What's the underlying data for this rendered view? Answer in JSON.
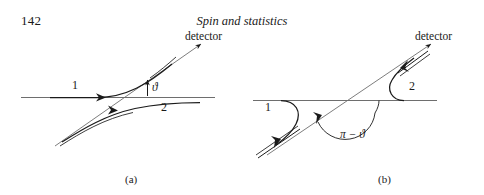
{
  "page": {
    "folio": "142",
    "running_title": "Spin and statistics",
    "width": 484,
    "height": 195,
    "background": "#ffffff",
    "ink": "#1a1a1a"
  },
  "figure": {
    "kind": "scattering-diagram-pair",
    "panels": [
      {
        "id": "a",
        "caption": "(a)",
        "detector_label": "detector",
        "trajectory_labels": [
          "1",
          "2"
        ],
        "angle_label": "ϑ",
        "angle_meaning": "scattering angle theta",
        "description": "Two incoming particle trajectories scatter and both leave toward the detector direction at angle theta above the horizontal axis."
      },
      {
        "id": "b",
        "caption": "(b)",
        "detector_label": "detector",
        "trajectory_labels": [
          "1",
          "2"
        ],
        "angle_label": "π − ϑ",
        "angle_meaning": "supplementary scattering angle pi minus theta",
        "description": "The exchanged process: trajectory 1 arrives from lower left and trajectory 2 leaves toward the detector, the angle measured from the axis is pi minus theta."
      }
    ]
  }
}
